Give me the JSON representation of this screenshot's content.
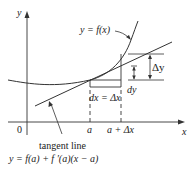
{
  "diagram": {
    "axes": {
      "x_label": "x",
      "y_label": "y",
      "origin_label": "0"
    },
    "x_ticks": {
      "a": "a",
      "a_plus_dx": "a + Δx"
    },
    "curve_label": "y = f(x)",
    "tangent_label": "tangent line",
    "tangent_equation": "y = f(a) + f ′(a)(x − a)",
    "dx_label": "dx = Δx",
    "dy_label": "dy",
    "delta_y_label": "Δy",
    "colors": {
      "line": "#333333",
      "text": "#222222",
      "background": "#ffffff"
    }
  }
}
